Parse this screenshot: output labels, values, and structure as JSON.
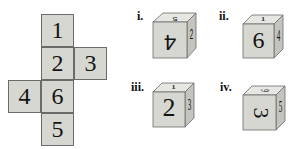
{
  "net": {
    "faces": [
      {
        "id": "top",
        "value": "1"
      },
      {
        "id": "middle",
        "value": "2"
      },
      {
        "id": "right",
        "value": "3"
      },
      {
        "id": "left",
        "value": "4"
      },
      {
        "id": "center-lower",
        "value": "6"
      },
      {
        "id": "bottom",
        "value": "5"
      }
    ]
  },
  "options": [
    {
      "label": "i.",
      "front": "4",
      "top": "5",
      "side": "2"
    },
    {
      "label": "ii.",
      "front": "6",
      "top": "1",
      "side": "4"
    },
    {
      "label": "iii.",
      "front": "2",
      "top": "1",
      "side": "3"
    },
    {
      "label": "iv.",
      "front": "3",
      "top": "9",
      "side": "5"
    }
  ],
  "colors": {
    "face": "#d7d7d2",
    "face_top": "#e6e6e2",
    "face_side": "#c4c4bf",
    "edge": "#6b6b6b",
    "ink": "#141414"
  }
}
